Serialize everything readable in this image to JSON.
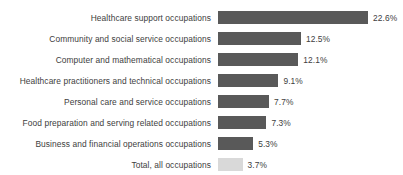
{
  "chart_data": {
    "type": "bar",
    "orientation": "horizontal",
    "title": "",
    "xlabel": "",
    "ylabel": "",
    "grid": false,
    "legend": false,
    "axis_visible": false,
    "value_suffix": "%",
    "xlim": [
      0,
      22.6
    ],
    "categories": [
      "Healthcare support occupations",
      "Community and social service occupations",
      "Computer and mathematical occupations",
      "Healthcare practitioners and technical occupations",
      "Personal care and service occupations",
      "Food preparation and serving related occupations",
      "Business and financial operations occupations",
      "Total, all occupations"
    ],
    "values": [
      22.6,
      12.5,
      12.1,
      9.1,
      7.7,
      7.3,
      5.3,
      3.7
    ],
    "value_labels": [
      "22.6%",
      "12.5%",
      "12.1%",
      "9.1%",
      "7.7%",
      "7.3%",
      "5.3%",
      "3.7%"
    ],
    "bar_colors": [
      "#595959",
      "#595959",
      "#595959",
      "#595959",
      "#595959",
      "#595959",
      "#595959",
      "#d9d9d9"
    ],
    "colors": {
      "bar_primary": "#595959",
      "bar_total": "#d9d9d9",
      "text": "#404040",
      "background": "#ffffff"
    }
  }
}
